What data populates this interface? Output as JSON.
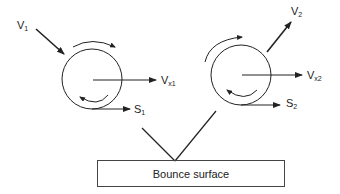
{
  "diagram": {
    "ball1": {
      "velocity_label": "V",
      "velocity_sub": "1",
      "vx_label": "V",
      "vx_sub": "x1",
      "spin_label": "S",
      "spin_sub": "1"
    },
    "ball2": {
      "velocity_label": "V",
      "velocity_sub": "2",
      "vx_label": "V",
      "vx_sub": "x2",
      "spin_label": "S",
      "spin_sub": "2"
    },
    "surface": {
      "label": "Bounce surface"
    },
    "colors": {
      "stroke": "#222222",
      "background": "#ffffff"
    }
  }
}
